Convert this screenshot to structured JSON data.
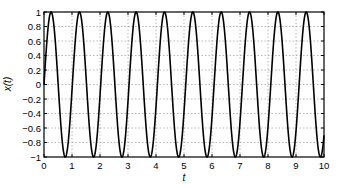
{
  "chart_data": {
    "type": "line",
    "title": "",
    "xlabel": "t",
    "ylabel": "x(t)",
    "xlim": [
      0,
      10
    ],
    "ylim": [
      -1,
      1
    ],
    "grid": true,
    "legend": null,
    "x_ticks": [
      "0",
      "1",
      "2",
      "3",
      "4",
      "5",
      "6",
      "7",
      "8",
      "9",
      "10"
    ],
    "y_ticks": [
      "1",
      "0.8",
      "0.6",
      "0.4",
      "0.2",
      "0",
      "−0.2",
      "−0.4",
      "−0.6",
      "−0.8",
      "−1"
    ],
    "series": [
      {
        "name": "x(t)",
        "function": "sin(2*pi*t/1.0125)",
        "period": 1.0125,
        "amplitude": 1,
        "color": "#000000"
      }
    ]
  }
}
